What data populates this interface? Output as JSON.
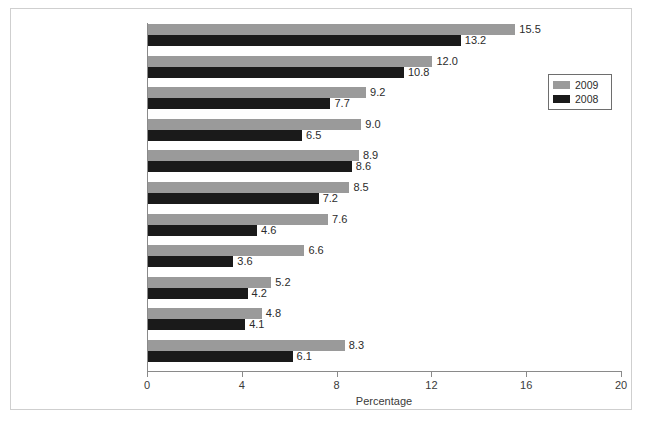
{
  "chart_data": {
    "type": "bar",
    "orientation": "horizontal",
    "title": "",
    "xlabel": "Percentage",
    "ylabel": "",
    "xlim": [
      0,
      20
    ],
    "xticks": [
      0,
      4,
      8,
      12,
      16,
      20
    ],
    "grid": false,
    "legend_position": "right",
    "categories": [
      "Newfoundland\nand Labrador",
      "Prince Edward Island",
      "Nova Scotia",
      "Ontario",
      "New Brunswick",
      "Quebec",
      "British Columbia",
      "Alberta",
      "Manitoba",
      "Saskatchewan",
      "Canada"
    ],
    "series": [
      {
        "name": "2009",
        "color": "#9a9a9a",
        "values": [
          15.5,
          12.0,
          9.2,
          9.0,
          8.9,
          8.5,
          7.6,
          6.6,
          5.2,
          4.8,
          8.3
        ],
        "labels": [
          "15.5",
          "12.0",
          "9.2",
          "9.0",
          "8.9",
          "8.5",
          "7.6",
          "6.6",
          "5.2",
          "4.8",
          "8.3"
        ]
      },
      {
        "name": "2008",
        "color": "#1a1a1a",
        "values": [
          13.2,
          10.8,
          7.7,
          6.5,
          8.6,
          7.2,
          4.6,
          3.6,
          4.2,
          4.1,
          6.1
        ],
        "labels": [
          "13.2",
          "10.8",
          "7.7",
          "6.5",
          "8.6",
          "7.2",
          "4.6",
          "3.6",
          "4.2",
          "4.1",
          "6.1"
        ]
      }
    ]
  },
  "legend": {
    "entries": [
      {
        "label": "2009",
        "color": "#9a9a9a"
      },
      {
        "label": "2008",
        "color": "#1a1a1a"
      }
    ]
  },
  "axis": {
    "x_title": "Percentage",
    "tick_labels": [
      "0",
      "4",
      "8",
      "12",
      "16",
      "20"
    ]
  }
}
